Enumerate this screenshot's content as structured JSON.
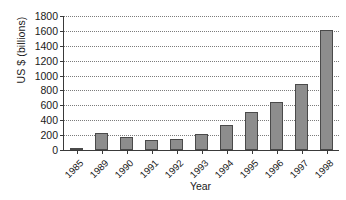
{
  "chart_data": {
    "type": "bar",
    "title": "",
    "xlabel": "Year",
    "ylabel": "US $ (billions)",
    "categories": [
      "1985",
      "1989",
      "1990",
      "1991",
      "1992",
      "1993",
      "1994",
      "1995",
      "1996",
      "1997",
      "1998"
    ],
    "values": [
      10,
      235,
      180,
      140,
      145,
      220,
      330,
      515,
      645,
      890,
      1610
    ],
    "ylim": [
      0,
      1800
    ],
    "ytick_labels": [
      "0",
      "200",
      "400",
      "600",
      "800",
      "1000",
      "1200",
      "1400",
      "1600",
      "1800"
    ],
    "ytick_values": [
      0,
      200,
      400,
      600,
      800,
      1000,
      1200,
      1400,
      1600,
      1800
    ],
    "grid": true,
    "grid_style": "dotted-horizontal",
    "legend": "none",
    "bar_color": "#8d8d8d",
    "bar_edge_color": "#4a4a4a",
    "axis_color": "#3a3a3a",
    "background_color": "#ffffff"
  }
}
